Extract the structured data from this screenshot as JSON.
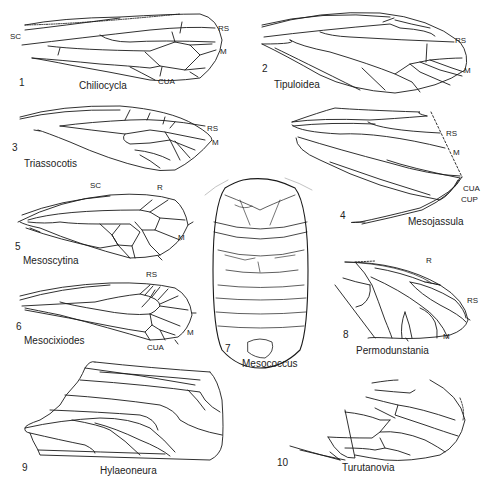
{
  "figure": {
    "background": "#ffffff",
    "ink": "#1a1a1a",
    "panels": [
      {
        "number": "1",
        "taxon": "Chiliocycla",
        "vein_labels": [
          "SC",
          "RS",
          "M",
          "CUA"
        ]
      },
      {
        "number": "2",
        "taxon": "Tipuloidea",
        "vein_labels": [
          "RS",
          "M"
        ]
      },
      {
        "number": "3",
        "taxon": "Triassocotis",
        "vein_labels": [
          "RS",
          "M"
        ]
      },
      {
        "number": "4",
        "taxon": "Mesojassula",
        "vein_labels": [
          "RS",
          "M",
          "CUA",
          "CUP"
        ]
      },
      {
        "number": "5",
        "taxon": "Mesoscytina",
        "vein_labels": [
          "SC",
          "R",
          "M"
        ]
      },
      {
        "number": "6",
        "taxon": "Mesocixiodes",
        "vein_labels": [
          "RS",
          "M",
          "CUA"
        ]
      },
      {
        "number": "7",
        "taxon": "Mesococcus",
        "vein_labels": []
      },
      {
        "number": "8",
        "taxon": "Permodunstania",
        "vein_labels": [
          "R",
          "RS",
          "M"
        ]
      },
      {
        "number": "9",
        "taxon": "Hylaeoneura",
        "vein_labels": []
      },
      {
        "number": "10",
        "taxon": "Turutanovia",
        "vein_labels": []
      }
    ]
  }
}
